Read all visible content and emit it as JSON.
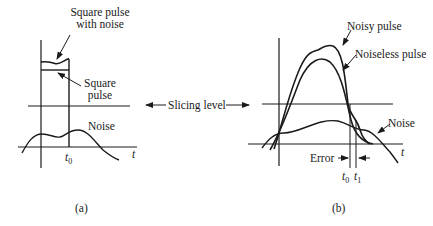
{
  "panel_a": {
    "caption": "(a)",
    "labels": {
      "square_pulse_with_noise_line1": "Square pulse",
      "square_pulse_with_noise_line2": "with noise",
      "square_pulse_line1": "Square",
      "square_pulse_line2": "pulse",
      "noise": "Noise",
      "t0": "t",
      "t0_sub": "0",
      "t_axis": "t"
    }
  },
  "slicing_level": "Slicing level",
  "panel_b": {
    "caption": "(b)",
    "labels": {
      "noisy_pulse": "Noisy pulse",
      "noiseless_pulse": "Noiseless pulse",
      "noise": "Noise",
      "error": "Error",
      "t0": "t",
      "t0_sub": "0",
      "t1": "t",
      "t1_sub": "1",
      "t_axis": "t"
    }
  },
  "colors": {
    "ink": "#1a1a1a",
    "background": "#ffffff"
  }
}
